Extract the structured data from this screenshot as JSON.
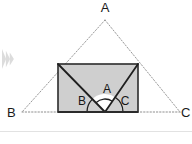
{
  "figure": {
    "type": "geometry-diagram",
    "background_color": "#ffffff",
    "outer_triangle": {
      "name": "triangle-abc",
      "stroke_style": "dotted",
      "stroke_color": "#9a9a9a",
      "vertices": [
        {
          "label": "A",
          "x": 105,
          "y": 20,
          "label_x": 105,
          "label_y": 12
        },
        {
          "label": "B",
          "x": 22,
          "y": 112,
          "label_x": 7,
          "label_y": 117
        },
        {
          "label": "C",
          "x": 180,
          "y": 112,
          "label_x": 181,
          "label_y": 117
        }
      ]
    },
    "rectangle": {
      "name": "inscribed-rectangle",
      "fill_color": "#cfcfcf",
      "stroke_color": "#2b2b2b",
      "x": 58,
      "y": 64,
      "width": 80,
      "height": 48
    },
    "diagonals": {
      "name": "angle-rays",
      "stroke_color": "#1f1f1f",
      "apex_x": 105,
      "apex_y": 112,
      "left_x": 58,
      "left_y": 64,
      "right_x": 138,
      "right_y": 64
    },
    "angle_arcs": [
      {
        "label": "B",
        "radius": 18,
        "name": "angle-arc-b"
      },
      {
        "label": "A",
        "radius": 13,
        "name": "angle-arc-a"
      },
      {
        "label": "C",
        "radius": 18,
        "name": "angle-arc-c"
      }
    ],
    "inner_labels": [
      {
        "label": "A",
        "x": 107,
        "y": 93,
        "name": "inner-label-a"
      },
      {
        "label": "B",
        "x": 82,
        "y": 105,
        "name": "inner-label-b"
      },
      {
        "label": "C",
        "x": 125,
        "y": 105,
        "name": "inner-label-c"
      }
    ],
    "play_icon": {
      "name": "play-chevron-icon",
      "color": "#dcdcdc",
      "x": 2,
      "y": 49,
      "width": 14,
      "height": 20
    },
    "bottom_divider": {
      "name": "bottom-divider",
      "color": "#e2e2e2",
      "y": 131
    }
  }
}
